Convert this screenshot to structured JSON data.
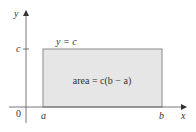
{
  "diagram": {
    "type": "area-under-constant-function",
    "axes": {
      "x_label": "x",
      "y_label": "y",
      "origin_label": "0"
    },
    "ticks": {
      "y_tick_label": "c",
      "x_tick_a_label": "a",
      "x_tick_b_label": "b"
    },
    "curve_label": "y = c",
    "region_label": "area = c(b − a)",
    "colors": {
      "axis": "#555555",
      "region_fill": "#e6e6e6",
      "region_stroke": "#888888",
      "text": "#333333"
    }
  }
}
